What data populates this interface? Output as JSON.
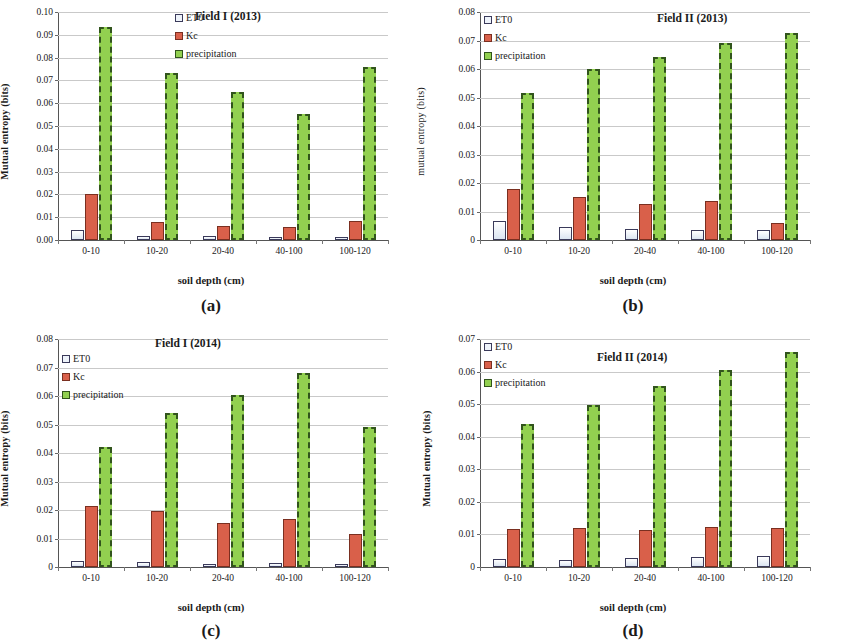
{
  "figure": {
    "categories": [
      "0-10",
      "10-20",
      "20-40",
      "40-100",
      "100-120"
    ],
    "xlabel": "soil depth (cm)",
    "series_names": {
      "et0": "ET0",
      "kc": "Kc",
      "precip": "precipitation"
    },
    "colors": {
      "et0": "#dbe5f1",
      "kc": "#d9604a",
      "precip": "#92d050",
      "precip_border": "#31541c"
    }
  },
  "chart_data": [
    {
      "panel": "a",
      "panel_letter": "(a)",
      "type": "bar",
      "title": "Field I (2013)",
      "xlabel": "soil depth (cm)",
      "ylabel": "Mutual entropy (bits)",
      "ylim": [
        0,
        0.1
      ],
      "ytick_step": 0.01,
      "ytick_labels": [
        "0.00",
        "0.01",
        "0.02",
        "0.03",
        "0.04",
        "0.05",
        "0.06",
        "0.07",
        "0.08",
        "0.09",
        "0.10"
      ],
      "categories": [
        "0-10",
        "10-20",
        "20-40",
        "40-100",
        "100-120"
      ],
      "grid": true,
      "legend_position": "top-center",
      "series": [
        {
          "name": "ET0",
          "values": [
            0.0043,
            0.0016,
            0.0018,
            0.0012,
            0.0013
          ]
        },
        {
          "name": "Kc",
          "values": [
            0.0202,
            0.0078,
            0.0063,
            0.0055,
            0.0083
          ]
        },
        {
          "name": "precipitation",
          "values": [
            0.0935,
            0.0733,
            0.065,
            0.0553,
            0.076
          ]
        }
      ]
    },
    {
      "panel": "b",
      "panel_letter": "(b)",
      "type": "bar",
      "title": "Field II (2013)",
      "xlabel": "soil depth (cm)",
      "ylabel": "mutual entropy (bits)",
      "ylim": [
        0,
        0.08
      ],
      "ytick_step": 0.01,
      "ytick_labels": [
        "0",
        "0.01",
        "0.02",
        "0.03",
        "0.04",
        "0.05",
        "0.06",
        "0.07",
        "0.08"
      ],
      "categories": [
        "0-10",
        "10-20",
        "20-40",
        "40-100",
        "100-120"
      ],
      "grid": true,
      "legend_position": "top-left",
      "series": [
        {
          "name": "ET0",
          "values": [
            0.0065,
            0.0047,
            0.004,
            0.0036,
            0.0035
          ]
        },
        {
          "name": "Kc",
          "values": [
            0.0178,
            0.015,
            0.0128,
            0.0136,
            0.0059
          ]
        },
        {
          "name": "precipitation",
          "values": [
            0.0515,
            0.06,
            0.0643,
            0.069,
            0.0725
          ]
        }
      ]
    },
    {
      "panel": "c",
      "panel_letter": "(c)",
      "type": "bar",
      "title": "Field I (2014)",
      "xlabel": "soil depth (cm)",
      "ylabel": "Mutual entropy (bits)",
      "ylim": [
        0,
        0.08
      ],
      "ytick_step": 0.01,
      "ytick_labels": [
        "0",
        "0.01",
        "0.02",
        "0.03",
        "0.04",
        "0.05",
        "0.06",
        "0.07",
        "0.08"
      ],
      "categories": [
        "0-10",
        "10-20",
        "20-40",
        "40-100",
        "100-120"
      ],
      "grid": true,
      "legend_position": "top-left",
      "series": [
        {
          "name": "ET0",
          "values": [
            0.0022,
            0.0017,
            0.0011,
            0.0015,
            0.0009
          ]
        },
        {
          "name": "Kc",
          "values": [
            0.0215,
            0.0198,
            0.0153,
            0.0168,
            0.0117
          ]
        },
        {
          "name": "precipitation",
          "values": [
            0.042,
            0.054,
            0.0605,
            0.068,
            0.0492
          ]
        }
      ]
    },
    {
      "panel": "d",
      "panel_letter": "(d)",
      "type": "bar",
      "title": "Field II (2014)",
      "xlabel": "soil depth (cm)",
      "ylabel": "Mutual entropy (bits)",
      "ylim": [
        0,
        0.07
      ],
      "ytick_step": 0.01,
      "ytick_labels": [
        "0",
        "0.01",
        "0.02",
        "0.03",
        "0.04",
        "0.05",
        "0.06",
        "0.07"
      ],
      "categories": [
        "0-10",
        "10-20",
        "20-40",
        "40-100",
        "100-120"
      ],
      "grid": true,
      "legend_position": "top-left",
      "series": [
        {
          "name": "ET0",
          "values": [
            0.0025,
            0.0021,
            0.0028,
            0.0032,
            0.0034
          ]
        },
        {
          "name": "Kc",
          "values": [
            0.0116,
            0.0119,
            0.0113,
            0.0123,
            0.012
          ]
        },
        {
          "name": "precipitation",
          "values": [
            0.044,
            0.0497,
            0.0555,
            0.0605,
            0.066
          ]
        }
      ]
    }
  ]
}
